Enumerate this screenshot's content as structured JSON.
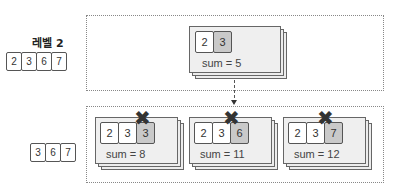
{
  "level": {
    "title": "레벨 2",
    "array": [
      "2",
      "3",
      "6",
      "7"
    ]
  },
  "remaining": {
    "array": [
      "3",
      "6",
      "7"
    ]
  },
  "parent": {
    "cells": [
      "2",
      "3"
    ],
    "highlighted_index": 1,
    "sum_label": "sum = 5"
  },
  "children": [
    {
      "cells": [
        "2",
        "3",
        "3"
      ],
      "highlighted_index": 2,
      "sum_label": "sum = 8",
      "pruned": true,
      "mark": "✖"
    },
    {
      "cells": [
        "2",
        "3",
        "6"
      ],
      "highlighted_index": 2,
      "sum_label": "sum = 11",
      "pruned": true,
      "mark": "✖"
    },
    {
      "cells": [
        "2",
        "3",
        "7"
      ],
      "highlighted_index": 2,
      "sum_label": "sum = 12",
      "pruned": true,
      "mark": "✖"
    }
  ],
  "colors": {
    "highlight": "#c9c9c9",
    "card": "#ececec",
    "border": "#666666"
  }
}
